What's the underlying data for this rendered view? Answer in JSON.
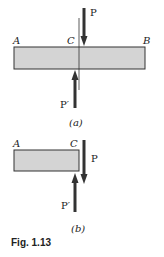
{
  "figure": {
    "caption": "Fig. 1.13",
    "colors": {
      "bar_fill": "#d4d4d4",
      "stroke": "#333333",
      "text": "#222222"
    },
    "panel_a": {
      "label": "(a)",
      "points": {
        "left": "A",
        "center": "C",
        "right": "B"
      },
      "forces": {
        "top": "P",
        "bottom": "P′"
      }
    },
    "panel_b": {
      "label": "(b)",
      "points": {
        "left": "A",
        "right": "C"
      },
      "forces": {
        "right": "P",
        "bottom": "P′"
      }
    }
  }
}
